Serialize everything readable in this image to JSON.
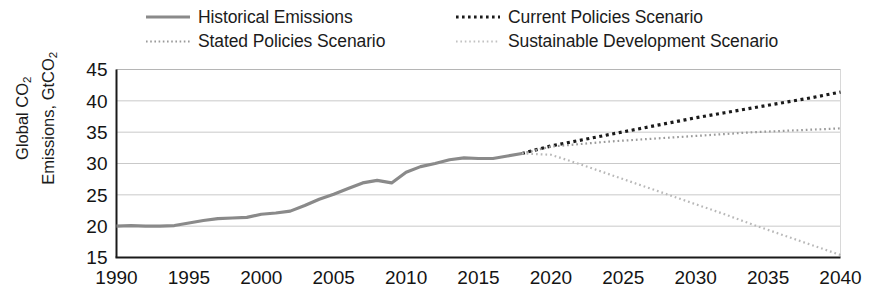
{
  "legend": {
    "items": [
      {
        "label": "Historical Emissions",
        "style": "solid",
        "color": "#8a8a8a",
        "name": "legend-historical-emissions"
      },
      {
        "label": "Stated Policies Scenario",
        "style": "fine-dot",
        "color": "#9a9a9a",
        "name": "legend-stated-policies-scenario"
      },
      {
        "label": "Current Policies Scenario",
        "style": "bold-dot",
        "color": "#1a1a1a",
        "name": "legend-current-policies-scenario"
      },
      {
        "label": "Sustainable Development Scenario",
        "style": "light-dot",
        "color": "#b8b8b8",
        "name": "legend-sustainable-development-scenario"
      }
    ]
  },
  "axes": {
    "ylabel_line1": "Global CO",
    "ylabel_line1_sub": "2",
    "ylabel_line2": "Emissions, GtCO",
    "ylabel_line2_sub": "2",
    "ylabel_full": "Global CO2 Emissions, GtCO2",
    "yticks": [
      15,
      20,
      25,
      30,
      35,
      40,
      45
    ],
    "xticks": [
      1990,
      1995,
      2000,
      2005,
      2010,
      2015,
      2020,
      2025,
      2030,
      2035,
      2040
    ]
  },
  "chart_data": {
    "type": "line",
    "title": "",
    "xlabel": "",
    "ylabel": "Global CO2 Emissions, GtCO2",
    "xlim": [
      1990,
      2040
    ],
    "ylim": [
      15,
      45
    ],
    "grid": true,
    "legend_position": "top",
    "series": [
      {
        "name": "Historical Emissions",
        "style": "solid",
        "color": "#8a8a8a",
        "x": [
          1990,
          1991,
          1992,
          1993,
          1994,
          1995,
          1996,
          1997,
          1998,
          1999,
          2000,
          2001,
          2002,
          2003,
          2004,
          2005,
          2006,
          2007,
          2008,
          2009,
          2010,
          2011,
          2012,
          2013,
          2014,
          2015,
          2016,
          2017,
          2018
        ],
        "values": [
          20.0,
          20.1,
          20.0,
          20.0,
          20.1,
          20.5,
          20.9,
          21.2,
          21.3,
          21.4,
          21.9,
          22.1,
          22.4,
          23.3,
          24.3,
          25.1,
          26.0,
          26.9,
          27.3,
          26.9,
          28.6,
          29.5,
          30.0,
          30.6,
          30.9,
          30.8,
          30.8,
          31.2,
          31.6
        ]
      },
      {
        "name": "Current Policies Scenario",
        "style": "bold-dot",
        "color": "#1a1a1a",
        "x": [
          2018,
          2020,
          2022,
          2024,
          2026,
          2028,
          2030,
          2032,
          2034,
          2036,
          2038,
          2040
        ],
        "values": [
          31.6,
          32.8,
          33.7,
          34.6,
          35.5,
          36.4,
          37.3,
          38.1,
          38.9,
          39.7,
          40.5,
          41.4
        ]
      },
      {
        "name": "Stated Policies Scenario",
        "style": "fine-dot",
        "color": "#9a9a9a",
        "x": [
          2018,
          2020,
          2022,
          2024,
          2026,
          2028,
          2030,
          2032,
          2034,
          2036,
          2038,
          2040
        ],
        "values": [
          31.6,
          32.7,
          33.1,
          33.5,
          33.8,
          34.1,
          34.4,
          34.7,
          35.0,
          35.2,
          35.4,
          35.6
        ]
      },
      {
        "name": "Sustainable Development Scenario",
        "style": "light-dot",
        "color": "#b8b8b8",
        "x": [
          2018,
          2020,
          2022,
          2024,
          2026,
          2028,
          2030,
          2032,
          2034,
          2036,
          2038,
          2040
        ],
        "values": [
          31.6,
          31.4,
          29.9,
          28.3,
          26.7,
          25.1,
          23.5,
          21.9,
          20.2,
          18.6,
          17.0,
          15.4
        ]
      }
    ]
  },
  "colors": {
    "axis": "#1a1a1a",
    "grid": "#c9c9c9",
    "background": "#ffffff"
  }
}
